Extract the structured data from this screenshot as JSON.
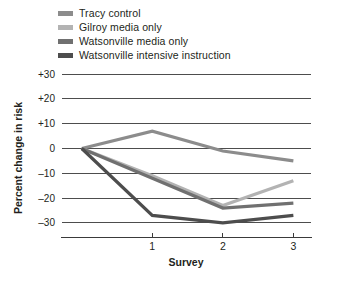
{
  "chart_data": {
    "type": "line",
    "title": "",
    "xlabel": "Survey",
    "ylabel": "Percent change in risk",
    "x": [
      0,
      1,
      2,
      3
    ],
    "x_tick_values": [
      1,
      2,
      3
    ],
    "x_tick_labels": [
      "1",
      "2",
      "3"
    ],
    "y_tick_labels": [
      "+30",
      "+20",
      "+10",
      "0",
      "–10",
      "–20",
      "–30"
    ],
    "y_tick_values": [
      30,
      20,
      10,
      0,
      -10,
      -20,
      -30
    ],
    "ylim": [
      -35,
      33
    ],
    "xlim": [
      -0.28,
      3.25
    ],
    "grid": true,
    "legend_position": "top-left-outside",
    "series": [
      {
        "name": "Tracy control",
        "color": "#8c8c8c",
        "values": [
          0,
          7,
          -1,
          -5
        ]
      },
      {
        "name": "Gilroy media only",
        "color": "#b3b3b3",
        "values": [
          0,
          -11,
          -23,
          -13
        ]
      },
      {
        "name": "Watsonville media only",
        "color": "#707070",
        "values": [
          0,
          -12,
          -24,
          -22
        ]
      },
      {
        "name": "Watsonville intensive instruction",
        "color": "#4d4d4d",
        "values": [
          0,
          -27,
          -30,
          -27
        ]
      }
    ]
  },
  "legend": {
    "items": [
      {
        "label": "Tracy control",
        "color": "#8c8c8c"
      },
      {
        "label": "Gilroy media only",
        "color": "#b3b3b3"
      },
      {
        "label": "Watsonville media only",
        "color": "#707070"
      },
      {
        "label": "Watsonville intensive instruction",
        "color": "#4d4d4d"
      }
    ]
  },
  "axes": {
    "y_title": "Percent change in risk",
    "x_title": "Survey",
    "y_labels": [
      "+30",
      "+20",
      "+10",
      "0",
      "–10",
      "–20",
      "–30"
    ],
    "x_labels": [
      "1",
      "2",
      "3"
    ]
  }
}
